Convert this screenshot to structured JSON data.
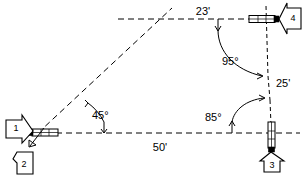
{
  "diagram": {
    "type": "technical-dimension-drawing",
    "units": "feet",
    "dimensions": {
      "top_segment": "23'",
      "right_segment": "25'",
      "bottom_segment": "50'"
    },
    "angles": {
      "left_corner": "45°",
      "upper_right_corner": "95°",
      "lower_right_corner": "85°"
    },
    "callouts": [
      {
        "id": "1",
        "label": "1",
        "direction": "right",
        "name": "callout-1"
      },
      {
        "id": "2",
        "label": "2",
        "direction": "up-left",
        "name": "callout-2"
      },
      {
        "id": "3",
        "label": "3",
        "direction": "up",
        "name": "callout-3"
      },
      {
        "id": "4",
        "label": "4",
        "direction": "left",
        "name": "callout-4"
      }
    ],
    "stakes": [
      {
        "id": "left",
        "orientation": "horizontal",
        "name": "stake-marker-left"
      },
      {
        "id": "top-right",
        "orientation": "horizontal",
        "name": "stake-marker-top-right"
      },
      {
        "id": "bottom-right",
        "orientation": "vertical",
        "name": "stake-marker-bottom-right"
      }
    ],
    "colors": {
      "line": "#000000",
      "background": "#ffffff"
    }
  }
}
